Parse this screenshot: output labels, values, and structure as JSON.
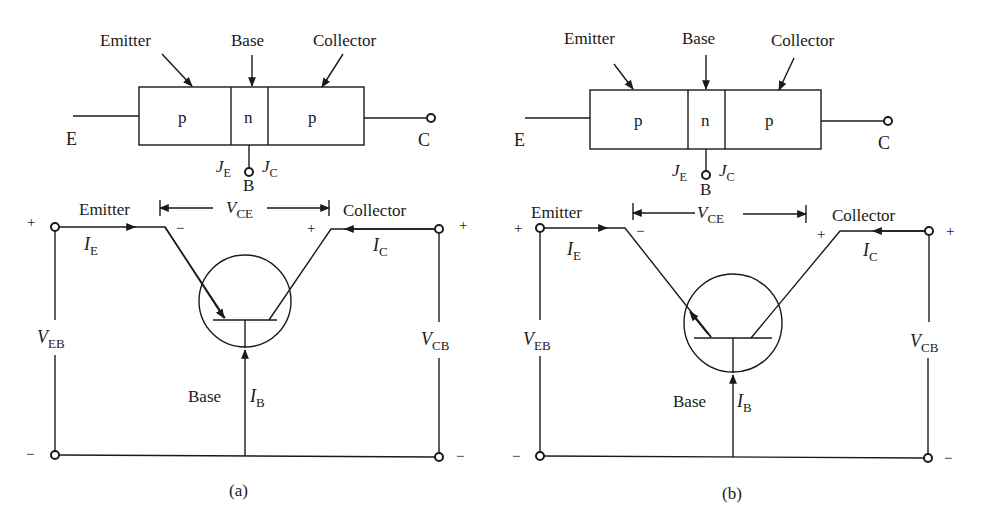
{
  "figures": [
    {
      "id": "a",
      "caption": "(a)",
      "structure": {
        "labels": {
          "emitter": "Emitter",
          "base": "Base",
          "collector": "Collector"
        },
        "regions": [
          "p",
          "n",
          "p"
        ],
        "terminals": {
          "E": "E",
          "C": "C",
          "B": "B"
        },
        "junctions": {
          "JE": "J",
          "JE_sub": "E",
          "JC": "J",
          "JC_sub": "C"
        }
      },
      "circuit": {
        "emitter_label": "Emitter",
        "collector_label": "Collector",
        "base_label": "Base",
        "vce": {
          "main": "V",
          "sub": "CE"
        },
        "veb": {
          "main": "V",
          "sub": "EB"
        },
        "vcb": {
          "main": "V",
          "sub": "CB"
        },
        "ie": {
          "main": "I",
          "sub": "E"
        },
        "ic": {
          "main": "I",
          "sub": "C"
        },
        "ib": {
          "main": "I",
          "sub": "B"
        },
        "plus": "+",
        "minus": "−",
        "emitter_arrow": "inward"
      }
    },
    {
      "id": "b",
      "caption": "(b)",
      "structure": {
        "labels": {
          "emitter": "Emitter",
          "base": "Base",
          "collector": "Collector"
        },
        "regions": [
          "p",
          "n",
          "p"
        ],
        "terminals": {
          "E": "E",
          "C": "C",
          "B": "B"
        },
        "junctions": {
          "JE": "J",
          "JE_sub": "E",
          "JC": "J",
          "JC_sub": "C"
        }
      },
      "circuit": {
        "emitter_label": "Emitter",
        "collector_label": "Collector",
        "base_label": "Base",
        "vce": {
          "main": "V",
          "sub": "CE"
        },
        "veb": {
          "main": "V",
          "sub": "EB"
        },
        "vcb": {
          "main": "V",
          "sub": "CB"
        },
        "ie": {
          "main": "I",
          "sub": "E"
        },
        "ic": {
          "main": "I",
          "sub": "C"
        },
        "ib": {
          "main": "I",
          "sub": "B"
        },
        "plus": "+",
        "minus": "−",
        "emitter_arrow": "outward"
      }
    }
  ],
  "colors": {
    "ink": "#1a1a1a",
    "background": "#ffffff"
  }
}
